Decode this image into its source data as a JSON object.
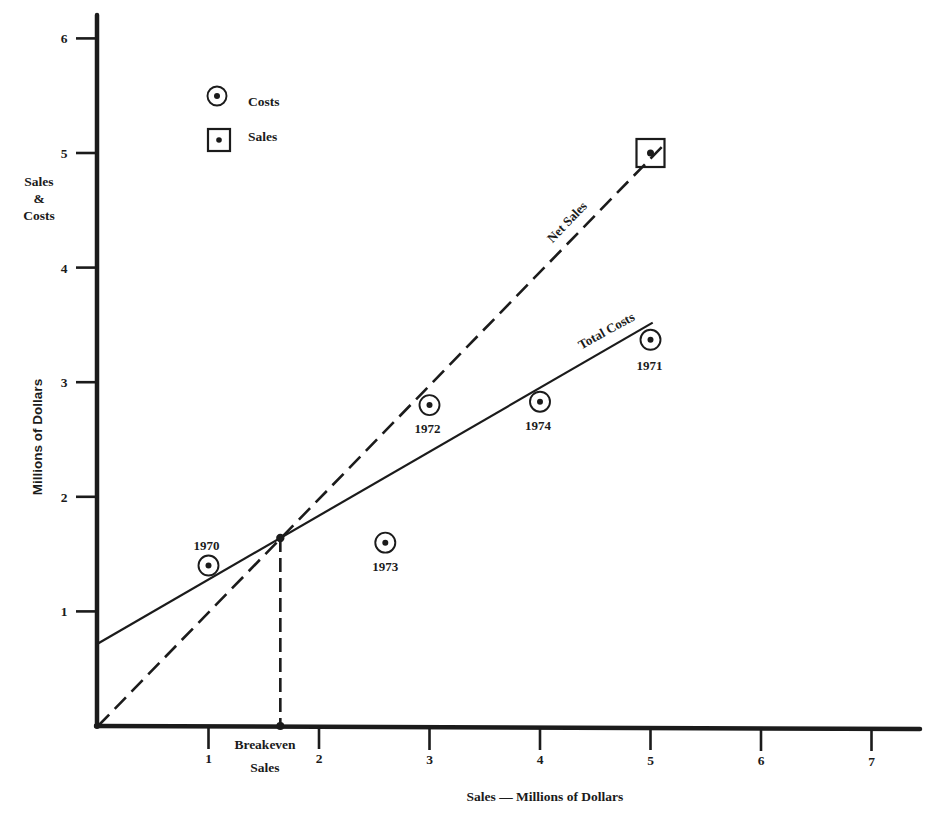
{
  "chart_data": {
    "type": "scatter",
    "title": "",
    "xlabel": "Sales — Millions of Dollars",
    "ylabel": [
      "Sales",
      "&",
      "Costs"
    ],
    "ylabel_rotated": "Millions of Dollars",
    "xlim": [
      0,
      7.5
    ],
    "ylim": [
      0,
      6.2
    ],
    "grid": false,
    "legend_position": "upper-left",
    "x_ticks": [
      "1",
      "2",
      "3",
      "4",
      "5",
      "6",
      "7"
    ],
    "y_ticks": [
      "1",
      "2",
      "3",
      "4",
      "5",
      "6"
    ],
    "legend": [
      {
        "label": "Costs",
        "marker": "circled-dot"
      },
      {
        "label": "Sales",
        "marker": "boxed-dot"
      }
    ],
    "series": [
      {
        "name": "Costs",
        "marker": "circled-dot",
        "points": [
          {
            "label": "1970",
            "x": 1.0,
            "y": 1.4
          },
          {
            "label": "1971",
            "x": 5.0,
            "y": 3.37
          },
          {
            "label": "1972",
            "x": 3.0,
            "y": 2.8
          },
          {
            "label": "1973",
            "x": 2.6,
            "y": 1.6
          },
          {
            "label": "1974",
            "x": 4.0,
            "y": 2.83
          }
        ]
      },
      {
        "name": "Sales",
        "marker": "boxed-dot",
        "points": [
          {
            "label": "",
            "x": 5.0,
            "y": 5.0
          }
        ]
      }
    ],
    "lines": [
      {
        "name": "Net Sales",
        "label": "Net Sales",
        "style": "dashed",
        "x": [
          0,
          5.15
        ],
        "y": [
          0,
          5.1
        ]
      },
      {
        "name": "Total Costs",
        "label": "Total Costs",
        "style": "solid",
        "x": [
          0,
          5.02
        ],
        "y": [
          0.72,
          3.52
        ]
      }
    ],
    "annotations": [
      {
        "label_line1": "Breakeven",
        "label_line2": "Sales",
        "x": 1.65,
        "y": 1.64
      }
    ]
  }
}
